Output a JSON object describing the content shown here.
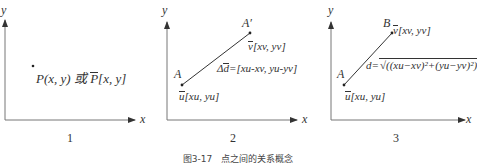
{
  "panels": [
    {
      "number": "1",
      "axis_x": "x",
      "axis_y": "y",
      "point_text": "P(x, y) 或 ",
      "vector_name": "P",
      "vector_coords": "[x, y]"
    },
    {
      "number": "2",
      "axis_x": "x",
      "axis_y": "y",
      "point_a": "A",
      "point_a_prime": "A′",
      "vec_u": "u",
      "vec_u_coords": "[xu, yu]",
      "vec_v": "v",
      "vec_v_coords": "[xv, yv]",
      "delta_prefix": "Δ",
      "delta_vec": "d",
      "delta_formula": "=[xu-xv, yu-yv]"
    },
    {
      "number": "3",
      "axis_x": "x",
      "axis_y": "y",
      "point_a": "A",
      "point_b": "B",
      "vec_u": "u",
      "vec_u_coords": "[xu, yu]",
      "vec_v": "v",
      "vec_v_coords": "[xv, yv]",
      "distance_label": "d=",
      "distance_formula": "√((xu−xv)²+(yu−yv)²)"
    }
  ],
  "caption": "图3-17　点之间的关系概念"
}
